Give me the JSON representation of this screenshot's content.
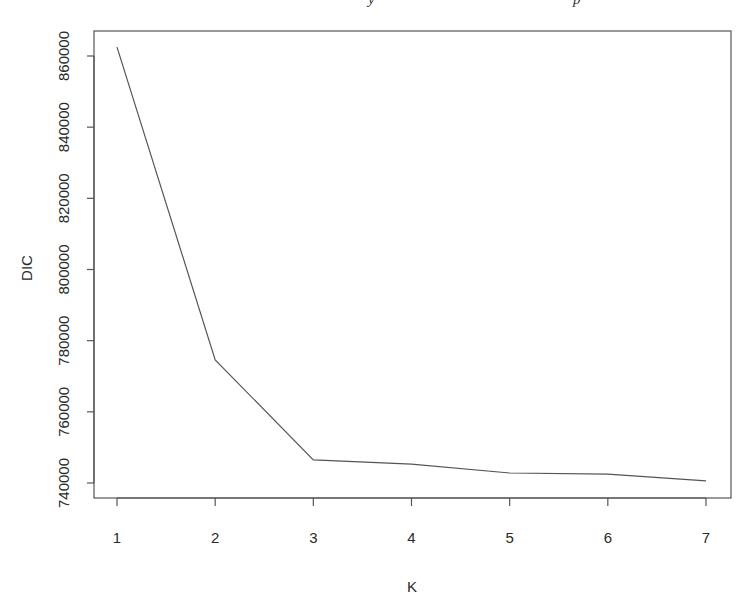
{
  "caption_fragments": [
    "y",
    "p"
  ],
  "chart_data": {
    "type": "line",
    "title": "",
    "xlabel": "K",
    "ylabel": "DIC",
    "x": [
      1,
      2,
      3,
      4,
      5,
      6,
      7
    ],
    "series": [
      {
        "name": "DIC",
        "values": [
          862500,
          774600,
          746500,
          745300,
          742800,
          742500,
          740600
        ]
      }
    ],
    "xticks": [
      1,
      2,
      3,
      4,
      5,
      6,
      7
    ],
    "yticks": [
      740000,
      760000,
      780000,
      800000,
      820000,
      840000,
      860000
    ],
    "xlim": [
      0.75,
      7.25
    ],
    "ylim": [
      736000,
      866000
    ],
    "grid": false,
    "legend": "none",
    "line_color": "#555555",
    "axis_color": "#555555"
  }
}
